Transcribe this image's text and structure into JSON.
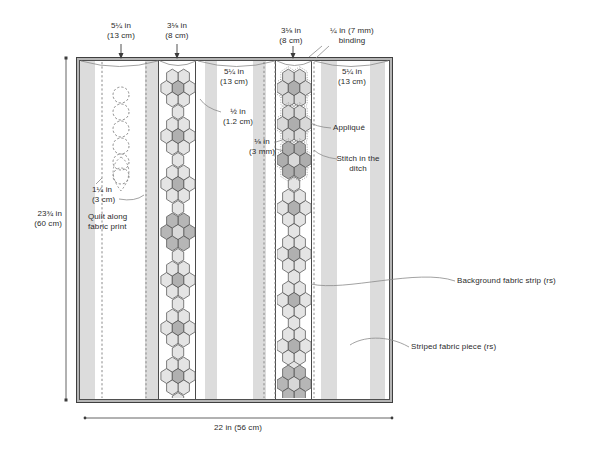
{
  "labels": {
    "top1": {
      "line1": "5¼ in",
      "line2": "(13 cm)"
    },
    "top2": {
      "line1": "3⅛ in",
      "line2": "(8 cm)"
    },
    "top3": {
      "line1": "3⅛ in",
      "line2": "(8 cm)"
    },
    "binding": {
      "line1": "¼ in (7 mm)",
      "line2": "binding"
    },
    "s3_width": {
      "line1": "5¼ in",
      "line2": "(13 cm)"
    },
    "s5_width": {
      "line1": "5¼ in",
      "line2": "(13 cm)"
    },
    "half_inch": {
      "line1": "½ in",
      "line2": "(1.2 cm)"
    },
    "eighth_inch": {
      "line1": "⅛ in",
      "line2": "(3 mm)"
    },
    "applique": "Appliqué",
    "ditch": {
      "line1": "Stitch in the",
      "line2": "ditch"
    },
    "inch_1_25": {
      "line1": "1¼ in",
      "line2": "(3 cm)"
    },
    "quilt_along": {
      "line1": "Quilt along",
      "line2": "fabric print"
    },
    "height": {
      "line1": "23¾ in",
      "line2": "(60 cm)"
    },
    "width_bottom": "22 in (56 cm)",
    "background_strip": "Background fabric strip (rs)",
    "striped_piece": "Striped fabric piece (rs)"
  },
  "colors": {
    "stroke": "#4a4a4a",
    "line": "#8a8a8a",
    "stitch": "#7d7d7d",
    "dim": "#3c3c3c",
    "stripe": "#dcdcdc",
    "binding_band": "#b6b6b6",
    "frame": "#3f3f3f",
    "text": "#2b2b2b",
    "connector": "#e4e4e4",
    "flower_styles": {
      "light": {
        "petal": "#e4e4e4",
        "center": "#b0b0b0",
        "ring": false
      },
      "dark": {
        "petal": "#b6b6b6",
        "center": "#d8d8d8",
        "ring": false
      },
      "stitched": {
        "petal": "#d9d9d9",
        "center": "#aeaeae",
        "ring": true
      },
      "stitched_dark": {
        "petal": "#aeaeae",
        "center": "#d9d9d9",
        "ring": true
      }
    }
  },
  "geometry": {
    "paths": [
      {
        "d": "M81,61 Q119.5,72 158,61",
        "name": "section-arc"
      },
      {
        "d": "M160,61 Q178,70 196,61",
        "name": "section-arc"
      },
      {
        "d": "M198,61 Q236.5,72 275,61",
        "name": "section-arc"
      },
      {
        "d": "M277,61 Q294.5,70 312,61",
        "name": "section-arc"
      },
      {
        "d": "M314,61 Q351,72 388,61",
        "name": "section-arc"
      },
      {
        "d": "M322,46 L309,57",
        "name": "binding-leader"
      },
      {
        "d": "M329,46 L316,58",
        "name": "binding-leader"
      },
      {
        "d": "M221,112 Q206,108 200,99",
        "name": "half-inch-leader"
      },
      {
        "d": "M276,142 L285,139",
        "name": "eighth-inch-leader"
      },
      {
        "d": "M276,149 L288,152",
        "name": "eighth-inch-leader"
      },
      {
        "d": "M331,128 Q316,127 307,121",
        "name": "applique-leader"
      },
      {
        "d": "M337,159 Q321,157 314,150",
        "name": "ditch-leader"
      },
      {
        "d": "M96,184 L102,178",
        "name": "quarter-inch-leader"
      },
      {
        "d": "M119,199 Q135,202 144,195",
        "name": "quarter-inch-leader"
      },
      {
        "d": "M455,281 C418,268 345,292 311,284",
        "name": "background-strip-leader"
      },
      {
        "d": "M409,347 C386,334 362,337 350,345",
        "name": "striped-piece-leader"
      },
      {
        "d": "M121,157 C130,163 133,176 121,191 C109,176 112,163 121,157",
        "dash": "2.2,2",
        "name": "quilting-teardrop"
      }
    ],
    "arrows": [
      {
        "x": 121,
        "y1": 44,
        "y2": 59
      },
      {
        "x": 177,
        "y1": 44,
        "y2": 59
      },
      {
        "x": 293,
        "y1": 46,
        "y2": 59
      }
    ],
    "dashed_vlines": [
      {
        "x": 102
      },
      {
        "x": 146
      },
      {
        "x": 264
      },
      {
        "x": 275
      },
      {
        "x": 314
      }
    ],
    "quilting_circles": {
      "cx": 121,
      "r": 8,
      "cys": [
        95,
        112,
        129,
        146,
        162,
        176
      ]
    },
    "dim_left": {
      "x": 66,
      "y1": 58,
      "y2": 400
    },
    "dim_bottom": {
      "y": 418,
      "x1": 85,
      "x2": 392
    },
    "hex": {
      "rx": 5.7,
      "ry": 7.5,
      "ym": 3.9,
      "pdx": 5.7,
      "pdy": 11.4,
      "sdx": 11.4
    },
    "strips": [
      {
        "cx": 178,
        "clip": [
          160,
          62,
          36,
          336
        ],
        "flowers": [
          {
            "cy": 88,
            "style": "light"
          },
          {
            "cy": 136,
            "style": "light"
          },
          {
            "cy": 184,
            "style": "light"
          },
          {
            "cy": 232,
            "style": "dark"
          },
          {
            "cy": 280,
            "style": "light"
          },
          {
            "cy": 328,
            "style": "light"
          },
          {
            "cy": 376,
            "style": "light"
          }
        ],
        "connectors": [
          112,
          160,
          208,
          256,
          304,
          352,
          400
        ]
      },
      {
        "cx": 294,
        "clip": [
          277,
          62,
          35,
          336
        ],
        "flowers": [
          {
            "cy": 88,
            "style": "stitched"
          },
          {
            "cy": 124,
            "style": "stitched"
          },
          {
            "cy": 160,
            "style": "stitched_dark"
          },
          {
            "cy": 208,
            "style": "light"
          },
          {
            "cy": 254,
            "style": "light"
          },
          {
            "cy": 300,
            "style": "light"
          },
          {
            "cy": 346,
            "style": "light"
          },
          {
            "cy": 384,
            "style": "dark"
          }
        ],
        "connectors": [
          184,
          231,
          277,
          323,
          367
        ]
      }
    ]
  }
}
